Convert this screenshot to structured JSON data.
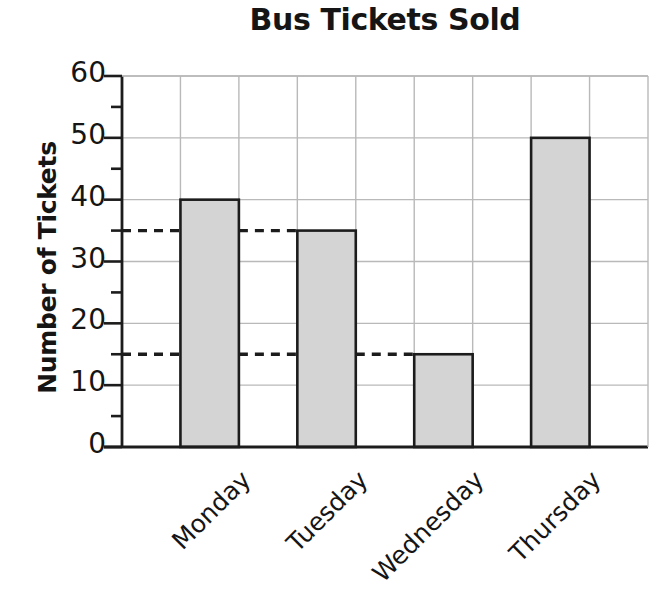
{
  "chart_data": {
    "type": "bar",
    "title": "Bus Tickets Sold",
    "xlabel": "",
    "ylabel": "Number of Tickets",
    "categories": [
      "Monday",
      "Tuesday",
      "Wednesday",
      "Thursday"
    ],
    "values": [
      40,
      35,
      15,
      50
    ],
    "ylim": [
      0,
      60
    ],
    "ytick_labels": [
      "0",
      "10",
      "20",
      "30",
      "40",
      "50",
      "60"
    ],
    "ytick_values": [
      0,
      10,
      20,
      30,
      40,
      50,
      60
    ],
    "yminor_values": [
      5,
      15,
      25,
      35,
      45,
      55
    ],
    "grid": true,
    "legend": null,
    "bar_fill": "#d4d4d4",
    "bar_stroke": "#1c1c1c",
    "grid_color": "#b9b9b9",
    "axis_color": "#1c1c1c",
    "reference_lines": [
      {
        "value": 35,
        "style": "dashed",
        "label": "35"
      },
      {
        "value": 15,
        "style": "dashed",
        "label": "15"
      }
    ]
  },
  "axes": {
    "y_title": "Number of Tickets"
  }
}
